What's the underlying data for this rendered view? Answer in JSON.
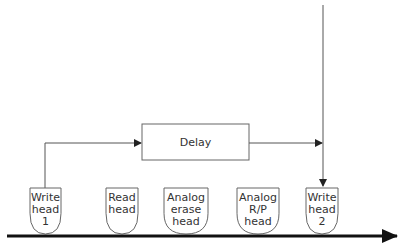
{
  "diagram": {
    "delay_box": {
      "label": "Delay",
      "x": 142,
      "y": 124,
      "w": 107,
      "h": 36
    },
    "heads": [
      {
        "id": "write-head-1",
        "lines": [
          "Write",
          "head",
          "1"
        ],
        "x": 30,
        "w": 31
      },
      {
        "id": "read-head",
        "lines": [
          "Read",
          "head"
        ],
        "x": 106,
        "w": 32
      },
      {
        "id": "analog-erase-head",
        "lines": [
          "Analog",
          "erase",
          "head"
        ],
        "x": 164,
        "w": 44
      },
      {
        "id": "analog-rp-head",
        "lines": [
          "Analog",
          "R/P",
          "head"
        ],
        "x": 237,
        "w": 42
      },
      {
        "id": "write-head-2",
        "lines": [
          "Write",
          "head",
          "2"
        ],
        "x": 306,
        "w": 32
      }
    ],
    "head_top": 188,
    "head_bottom": 234,
    "tape": {
      "y": 236,
      "x_start": 7,
      "x_end": 397,
      "direction": "right"
    },
    "colors": {
      "line": "#555555",
      "tape": "#111111",
      "text": "#333333"
    }
  }
}
